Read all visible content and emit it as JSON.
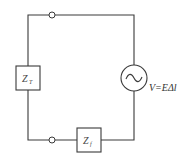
{
  "diagram": {
    "type": "circuit",
    "components": [
      {
        "id": "zt",
        "label": "Z",
        "subscript": "T",
        "kind": "impedance",
        "position": "left"
      },
      {
        "id": "zf",
        "label": "Z",
        "subscript": "f",
        "kind": "impedance",
        "position": "bottom"
      },
      {
        "id": "source",
        "kind": "ac-voltage-source",
        "position": "right",
        "symbol": "~"
      }
    ],
    "source_label": "V=EΔl",
    "terminals": 2,
    "colors": {
      "line": "#3a3a3a",
      "background": "#ffffff"
    }
  }
}
